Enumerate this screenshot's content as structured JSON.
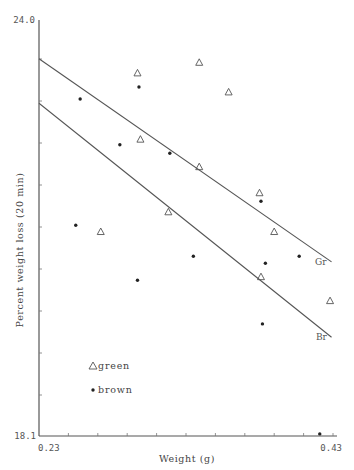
{
  "chart_data": {
    "type": "scatter",
    "title": "",
    "xlabel": "Weight (g)",
    "ylabel": "Percent weight loss (20 min)",
    "xlim": [
      0.23,
      0.43
    ],
    "ylim": [
      18.1,
      24.0
    ],
    "x_tick_labels": [
      "0.23",
      "0.43"
    ],
    "y_tick_labels": [
      "24.0",
      "18.1"
    ],
    "grid": false,
    "legend_position": "lower-left inside",
    "series": [
      {
        "name": "green",
        "marker": "triangle-open",
        "points": [
          {
            "x": 0.297,
            "y": 23.25
          },
          {
            "x": 0.339,
            "y": 23.4
          },
          {
            "x": 0.359,
            "y": 22.98
          },
          {
            "x": 0.299,
            "y": 22.31
          },
          {
            "x": 0.339,
            "y": 21.92
          },
          {
            "x": 0.318,
            "y": 21.28
          },
          {
            "x": 0.272,
            "y": 21.0
          },
          {
            "x": 0.38,
            "y": 21.55
          },
          {
            "x": 0.39,
            "y": 21.0
          },
          {
            "x": 0.381,
            "y": 20.36
          },
          {
            "x": 0.428,
            "y": 20.02
          }
        ]
      },
      {
        "name": "brown",
        "marker": "dot",
        "points": [
          {
            "x": 0.258,
            "y": 22.88
          },
          {
            "x": 0.298,
            "y": 23.05
          },
          {
            "x": 0.285,
            "y": 22.23
          },
          {
            "x": 0.319,
            "y": 22.11
          },
          {
            "x": 0.381,
            "y": 21.43
          },
          {
            "x": 0.255,
            "y": 21.09
          },
          {
            "x": 0.335,
            "y": 20.65
          },
          {
            "x": 0.384,
            "y": 20.55
          },
          {
            "x": 0.407,
            "y": 20.65
          },
          {
            "x": 0.297,
            "y": 20.31
          },
          {
            "x": 0.382,
            "y": 19.69
          },
          {
            "x": 0.421,
            "y": 18.13
          }
        ]
      }
    ],
    "regression_lines": [
      {
        "label": "Gr",
        "series": "green",
        "x": [
          0.23,
          0.429
        ],
        "y": [
          23.45,
          20.57
        ]
      },
      {
        "label": "Br",
        "series": "brown",
        "x": [
          0.23,
          0.429
        ],
        "y": [
          22.82,
          19.5
        ]
      }
    ]
  },
  "legend": {
    "green_label": "green",
    "brown_label": "brown"
  },
  "axes": {
    "y_top": "24.0",
    "y_bottom": "18.1",
    "x_left": "0.23",
    "x_right": "0.43",
    "xlabel": "Weight (g)",
    "ylabel": "Percent weight loss (20 min)"
  },
  "lines": {
    "gr_label": "Gr",
    "br_label": "Br"
  }
}
